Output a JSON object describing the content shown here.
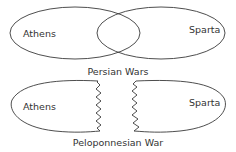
{
  "diagrams": [
    {
      "type": "venn",
      "caption": "Persian Wars",
      "sets": [
        {
          "label": "Athens"
        },
        {
          "label": "Sparta"
        }
      ],
      "relationship": "overlapping"
    },
    {
      "type": "split-shapes",
      "caption": "Peloponnesian War",
      "sets": [
        {
          "label": "Athens"
        },
        {
          "label": "Sparta"
        }
      ],
      "relationship": "broken-apart"
    }
  ],
  "colors": {
    "line": "#3a3a3a",
    "text": "#333333",
    "background": "#ffffff"
  }
}
